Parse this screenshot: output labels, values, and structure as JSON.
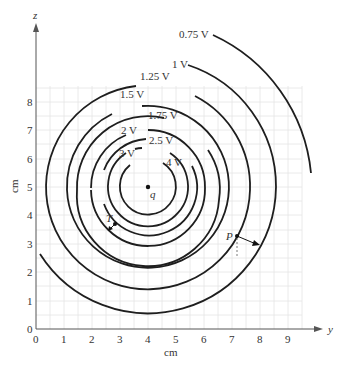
{
  "figure": {
    "type": "equipotential-diagram",
    "x_axis": {
      "name": "y",
      "unit_label": "cm",
      "ticks": [
        "0",
        "1",
        "2",
        "3",
        "4",
        "5",
        "6",
        "7",
        "8",
        "9"
      ]
    },
    "y_axis": {
      "name": "z",
      "unit_label": "cm",
      "ticks": [
        "0",
        "1",
        "2",
        "3",
        "4",
        "5",
        "6",
        "7",
        "8"
      ]
    },
    "charge": {
      "label": "q",
      "position_cm": [
        4,
        5
      ]
    },
    "equipotentials": [
      {
        "label": "4 V"
      },
      {
        "label": "3 V"
      },
      {
        "label": "2.5 V"
      },
      {
        "label": "2 V"
      },
      {
        "label": "1.75 V"
      },
      {
        "label": "1.5 V"
      },
      {
        "label": "1.25 V"
      },
      {
        "label": "1 V"
      },
      {
        "label": "0.75 V"
      }
    ],
    "points": [
      {
        "label": "T"
      },
      {
        "label": "P"
      }
    ],
    "colors": {
      "curve": "#1e1e1e",
      "grid": "#e4e4e4",
      "text": "#333333"
    }
  }
}
